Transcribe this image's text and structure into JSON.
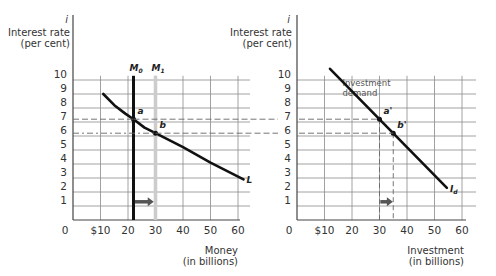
{
  "chart_data": [
    {
      "type": "line",
      "title": "Money market",
      "ylabel_symbol": "i",
      "ylabel": [
        "Interest rate",
        "(per cent)"
      ],
      "xlabel": [
        "Money",
        "(in billions)"
      ],
      "x_ticks": [
        "0",
        "$10",
        "20",
        "30",
        "40",
        "50",
        "60"
      ],
      "y_ticks": [
        "1",
        "2",
        "3",
        "4",
        "5",
        "6",
        "7",
        "8",
        "9",
        "10"
      ],
      "xlim": [
        0,
        60
      ],
      "ylim": [
        0,
        10
      ],
      "grid": true,
      "series": [
        {
          "name": "L",
          "label": "L",
          "style": "curve",
          "points": [
            [
              11,
              9.0
            ],
            [
              15,
              8.2
            ],
            [
              19,
              7.6
            ],
            [
              22,
              7.2
            ],
            [
              26,
              6.6
            ],
            [
              30,
              6.2
            ],
            [
              40,
              5.2
            ],
            [
              50,
              4.1
            ],
            [
              62,
              2.9
            ]
          ]
        },
        {
          "name": "M0",
          "label": "M",
          "label_sub": "0",
          "style": "vertical",
          "x": 22,
          "y_range": [
            0,
            10.3
          ],
          "color": "#111111"
        },
        {
          "name": "M1",
          "label": "M",
          "label_sub": "1",
          "style": "vertical",
          "x": 30,
          "y_range": [
            0,
            10.3
          ],
          "color": "#cccccc"
        }
      ],
      "points": [
        {
          "label": "a",
          "x": 22,
          "y": 7.2
        },
        {
          "label": "b",
          "x": 30,
          "y": 6.2
        }
      ],
      "arrow": {
        "from": 22.5,
        "to": 29,
        "y": 1.3
      }
    },
    {
      "type": "line",
      "title": "Investment demand",
      "ylabel_symbol": "i",
      "ylabel": [
        "Interest rate",
        "(per cent)"
      ],
      "xlabel": [
        "Investment",
        "(in billions)"
      ],
      "x_ticks": [
        "0",
        "$10",
        "20",
        "30",
        "40",
        "50",
        "60"
      ],
      "y_ticks": [
        "1",
        "2",
        "3",
        "4",
        "5",
        "6",
        "7",
        "8",
        "9",
        "10"
      ],
      "xlim": [
        0,
        60
      ],
      "ylim": [
        0,
        10
      ],
      "grid": true,
      "annotation": [
        "Investment",
        "demand"
      ],
      "series": [
        {
          "name": "Id",
          "label": "I",
          "label_sub": "d",
          "style": "line",
          "points": [
            [
              12,
              10.8
            ],
            [
              30,
              7.2
            ],
            [
              35,
              6.2
            ],
            [
              54.5,
              2.3
            ]
          ]
        }
      ],
      "points": [
        {
          "label": "a'",
          "x": 30,
          "y": 7.2
        },
        {
          "label": "b'",
          "x": 35,
          "y": 6.2
        }
      ],
      "dashed_verticals": [
        30,
        35
      ],
      "arrow": {
        "from": 30.3,
        "to": 34.5,
        "y": 1.3
      }
    }
  ],
  "colors": {
    "grid": "#8a8a8a",
    "axis": "#444444",
    "curve": "#111111",
    "arrow": "#555555",
    "dashed": "#666666",
    "m1": "#cccccc"
  }
}
